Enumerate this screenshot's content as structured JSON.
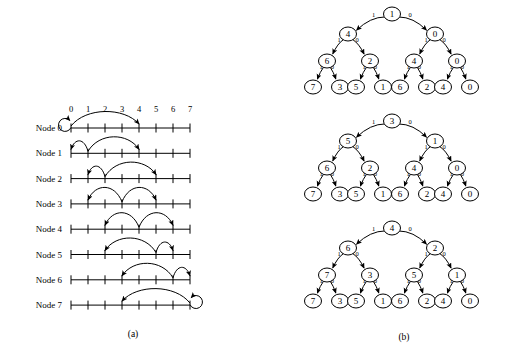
{
  "figure": {
    "captions": {
      "left": "(a)",
      "right": "(b)"
    }
  },
  "chart_data": {
    "type": "diagram",
    "title": "",
    "panels": [
      {
        "id": "a",
        "caption": "(a)",
        "type": "interval-arc-diagram",
        "axis": {
          "tick_labels": [
            "0",
            "1",
            "2",
            "3",
            "4",
            "5",
            "6",
            "7"
          ],
          "min": 0,
          "max": 7,
          "ticks": 8
        },
        "row_label_prefix": "Node",
        "rows": [
          {
            "label": "Node 0",
            "source": 0,
            "self_loop": true,
            "arcs": [
              {
                "from": 0,
                "to": 0
              },
              {
                "from": 0,
                "to": 4
              }
            ]
          },
          {
            "label": "Node 1",
            "source": 1,
            "self_loop": false,
            "arcs": [
              {
                "from": 1,
                "to": 0
              },
              {
                "from": 1,
                "to": 4
              }
            ]
          },
          {
            "label": "Node 2",
            "source": 2,
            "self_loop": false,
            "arcs": [
              {
                "from": 2,
                "to": 1
              },
              {
                "from": 2,
                "to": 5
              }
            ]
          },
          {
            "label": "Node 3",
            "source": 3,
            "self_loop": false,
            "arcs": [
              {
                "from": 3,
                "to": 1
              },
              {
                "from": 3,
                "to": 5
              }
            ]
          },
          {
            "label": "Node 4",
            "source": 4,
            "self_loop": false,
            "arcs": [
              {
                "from": 4,
                "to": 2
              },
              {
                "from": 4,
                "to": 6
              }
            ]
          },
          {
            "label": "Node 5",
            "source": 5,
            "self_loop": false,
            "arcs": [
              {
                "from": 5,
                "to": 2
              },
              {
                "from": 5,
                "to": 6
              }
            ]
          },
          {
            "label": "Node 6",
            "source": 6,
            "self_loop": false,
            "arcs": [
              {
                "from": 6,
                "to": 3
              },
              {
                "from": 6,
                "to": 7
              }
            ]
          },
          {
            "label": "Node 7",
            "source": 7,
            "self_loop": true,
            "arcs": [
              {
                "from": 7,
                "to": 3
              },
              {
                "from": 7,
                "to": 7
              }
            ]
          }
        ]
      },
      {
        "id": "b",
        "caption": "(b)",
        "type": "binary-trees",
        "edge_labels": {
          "left": "1",
          "right": "0"
        },
        "trees": [
          {
            "name": "tree-top",
            "root": "1",
            "level2": [
              "4",
              "0"
            ],
            "level3": [
              "6",
              "2",
              "4",
              "0"
            ],
            "leaves": [
              "7",
              "3",
              "5",
              "1",
              "6",
              "2",
              "4",
              "0"
            ]
          },
          {
            "name": "tree-middle",
            "root": "3",
            "level2": [
              "5",
              "1"
            ],
            "level3": [
              "6",
              "2",
              "4",
              "0"
            ],
            "leaves": [
              "7",
              "3",
              "5",
              "1",
              "6",
              "2",
              "4",
              "0"
            ]
          },
          {
            "name": "tree-bottom",
            "root": "4",
            "level2": [
              "6",
              "2"
            ],
            "level3": [
              "7",
              "3",
              "5",
              "1"
            ],
            "leaves": [
              "7",
              "3",
              "5",
              "1",
              "6",
              "2",
              "4",
              "0"
            ]
          }
        ]
      }
    ]
  }
}
